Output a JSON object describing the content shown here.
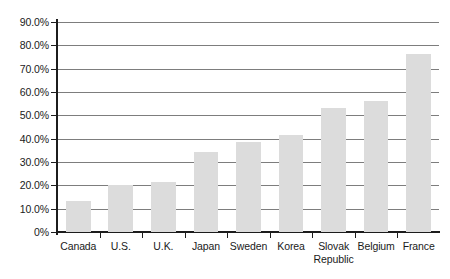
{
  "chart_data": {
    "type": "bar",
    "title": "",
    "subtitle": "",
    "xlabel": "",
    "ylabel": "",
    "categories": [
      "Canada",
      "U.S.",
      "U.K.",
      "Japan",
      "Sweden",
      "Korea",
      "Slovak Republic",
      "Belgium",
      "France"
    ],
    "category_lines": [
      [
        "Canada"
      ],
      [
        "U.S."
      ],
      [
        "U.K."
      ],
      [
        "Japan"
      ],
      [
        "Sweden"
      ],
      [
        "Korea"
      ],
      [
        "Slovak",
        "Republic"
      ],
      [
        "Belgium"
      ],
      [
        "France"
      ]
    ],
    "values": [
      13.3,
      20.0,
      21.3,
      34.4,
      38.7,
      41.7,
      53.3,
      56.3,
      76.5
    ],
    "value_unit": "percent",
    "ylim": [
      0,
      90
    ],
    "ytick_values": [
      0,
      10,
      20,
      30,
      40,
      50,
      60,
      70,
      80,
      90
    ],
    "ytick_labels": [
      "0%",
      "10.0%",
      "20.0%",
      "30.0%",
      "40.0%",
      "50.0%",
      "60.0%",
      "70.0%",
      "80.0%",
      "90.0%"
    ],
    "grid": "horizontal",
    "legend": "none",
    "series": [
      {
        "name": "",
        "values": [
          13.3,
          20.0,
          21.3,
          34.4,
          38.7,
          41.7,
          53.3,
          56.3,
          76.5
        ]
      }
    ],
    "colors": {
      "bar_fill": "#dcdcdc",
      "gridline": "#7d7d7d",
      "axis": "#1c1c1c",
      "text": "#1a1a1a",
      "background": "#ffffff"
    }
  }
}
